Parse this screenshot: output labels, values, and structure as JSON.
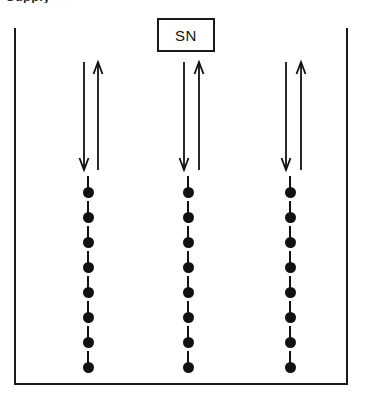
{
  "figure": {
    "caption_remnant": "Supply",
    "vessel": {
      "name": "open-top-enclosure",
      "open_side": "top",
      "border_color": "#1a1a1a",
      "border_width_px": 2,
      "left_px": 14,
      "top_px": 28,
      "width_px": 334,
      "height_px": 357
    },
    "label_box": {
      "text": "SN",
      "border_color": "#1a1a1a",
      "fill": "#ffffff",
      "left_px": 157,
      "top_px": 18,
      "width_px": 58,
      "height_px": 34
    },
    "stroke_color": "#111111",
    "columns": [
      {
        "id": "column-left",
        "center_x_px": 88,
        "arrows": [
          {
            "direction": "down",
            "x_px": 84,
            "y_top_px": 62,
            "y_bottom_px": 170
          },
          {
            "direction": "up",
            "x_px": 98,
            "y_top_px": 62,
            "y_bottom_px": 170
          }
        ],
        "chain": {
          "unit_count": 8,
          "first_unit_top_px": 176,
          "unit_spacing_px": 25,
          "unit": {
            "stem_height_px": 13,
            "dot_diameter_px": 11
          }
        }
      },
      {
        "id": "column-middle",
        "center_x_px": 188,
        "arrows": [
          {
            "direction": "down",
            "x_px": 184,
            "y_top_px": 62,
            "y_bottom_px": 170
          },
          {
            "direction": "up",
            "x_px": 199,
            "y_top_px": 62,
            "y_bottom_px": 170
          }
        ],
        "chain": {
          "unit_count": 8,
          "first_unit_top_px": 176,
          "unit_spacing_px": 25,
          "unit": {
            "stem_height_px": 13,
            "dot_diameter_px": 11
          }
        }
      },
      {
        "id": "column-right",
        "center_x_px": 290,
        "arrows": [
          {
            "direction": "down",
            "x_px": 286,
            "y_top_px": 62,
            "y_bottom_px": 170
          },
          {
            "direction": "up",
            "x_px": 301,
            "y_top_px": 62,
            "y_bottom_px": 170
          }
        ],
        "chain": {
          "unit_count": 8,
          "first_unit_top_px": 176,
          "unit_spacing_px": 25,
          "unit": {
            "stem_height_px": 13,
            "dot_diameter_px": 11
          }
        }
      }
    ]
  }
}
